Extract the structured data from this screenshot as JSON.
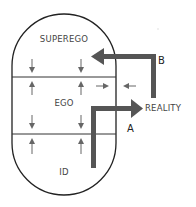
{
  "diagram": {
    "regions": {
      "superego": "SUPEREGO",
      "ego": "EGO",
      "id": "ID"
    },
    "external": "REALITY",
    "arrows": {
      "a_label": "A",
      "b_label": "B"
    },
    "colors": {
      "outline": "#222222",
      "thick_arrow": "#555555",
      "small_arrow": "#666666",
      "text": "#444444",
      "background": "#ffffff"
    }
  }
}
